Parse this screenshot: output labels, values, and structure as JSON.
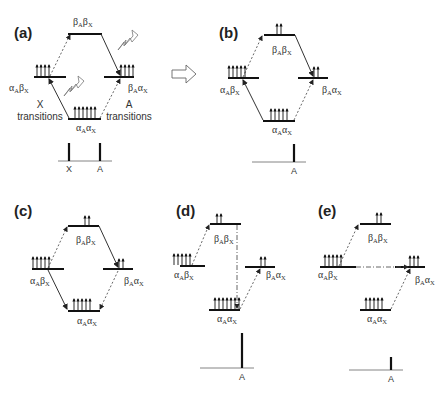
{
  "figure": {
    "panels": [
      {
        "id": "a",
        "label": "(a)",
        "states": {
          "top": {
            "main1": "β",
            "sub1": "A",
            "main2": "β",
            "sub2": "X",
            "spins": 0
          },
          "left": {
            "main1": "α",
            "sub1": "A",
            "main2": "β",
            "sub2": "X",
            "spins": 4
          },
          "right": {
            "main1": "β",
            "sub1": "A",
            "main2": "α",
            "sub2": "X",
            "spins": 4
          },
          "bottom": {
            "main1": "α",
            "sub1": "A",
            "main2": "α",
            "sub2": "X",
            "spins": 6
          }
        },
        "annotations": {
          "x_transitions": [
            "X",
            "transitions"
          ],
          "a_transitions": [
            "A",
            "transitions"
          ]
        },
        "spectrum": {
          "peaks": [
            {
              "label": "X",
              "intensity": 1
            },
            {
              "label": "A",
              "intensity": 1
            }
          ]
        }
      },
      {
        "id": "b",
        "label": "(b)",
        "states": {
          "top": {
            "main1": "β",
            "sub1": "A",
            "main2": "β",
            "sub2": "X",
            "spins": 2
          },
          "left": {
            "main1": "α",
            "sub1": "A",
            "main2": "β",
            "sub2": "X",
            "spins": 5
          },
          "right": {
            "main1": "β",
            "sub1": "A",
            "main2": "α",
            "sub2": "X",
            "spins": 2
          },
          "bottom": {
            "main1": "α",
            "sub1": "A",
            "main2": "α",
            "sub2": "X",
            "spins": 5
          }
        },
        "spectrum": {
          "peaks": [
            {
              "label": "A",
              "intensity": 1
            }
          ]
        }
      },
      {
        "id": "c",
        "label": "(c)",
        "states": {
          "top": {
            "main1": "β",
            "sub1": "A",
            "main2": "β",
            "sub2": "X",
            "spins": 2
          },
          "left": {
            "main1": "α",
            "sub1": "A",
            "main2": "β",
            "sub2": "X",
            "spins": 5
          },
          "right": {
            "main1": "β",
            "sub1": "A",
            "main2": "α",
            "sub2": "X",
            "spins": 2
          },
          "bottom": {
            "main1": "α",
            "sub1": "A",
            "main2": "α",
            "sub2": "X",
            "spins": 5
          }
        }
      },
      {
        "id": "d",
        "label": "(d)",
        "states": {
          "top": {
            "main1": "β",
            "sub1": "A",
            "main2": "β",
            "sub2": "X",
            "spins": 2
          },
          "left": {
            "main1": "α",
            "sub1": "A",
            "main2": "β",
            "sub2": "X",
            "spins": 5
          },
          "right": {
            "main1": "β",
            "sub1": "A",
            "main2": "α",
            "sub2": "X",
            "spins": 2
          },
          "bottom": {
            "main1": "α",
            "sub1": "A",
            "main2": "α",
            "sub2": "X",
            "spins": 7
          }
        },
        "spectrum": {
          "peaks": [
            {
              "label": "A",
              "intensity": 2.2
            }
          ]
        }
      },
      {
        "id": "e",
        "label": "(e)",
        "states": {
          "top": {
            "main1": "β",
            "sub1": "A",
            "main2": "β",
            "sub2": "X",
            "spins": 2
          },
          "left": {
            "main1": "α",
            "sub1": "A",
            "main2": "β",
            "sub2": "X",
            "spins": 5
          },
          "right": {
            "main1": "β",
            "sub1": "A",
            "main2": "α",
            "sub2": "X",
            "spins": 3
          },
          "bottom": {
            "main1": "α",
            "sub1": "A",
            "main2": "α",
            "sub2": "X",
            "spins": 5
          }
        },
        "spectrum": {
          "peaks": [
            {
              "label": "A",
              "intensity": 0.7
            }
          ]
        }
      }
    ],
    "arrow_between": "a-to-b"
  }
}
